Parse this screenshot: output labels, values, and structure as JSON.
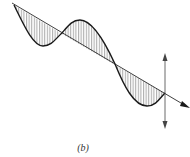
{
  "figure": {
    "caption": "(b)",
    "colors": {
      "wave": "#1a1a1a",
      "axis": "#2a2a2a",
      "hatch": "#555555",
      "arrow": "#444444",
      "background": "#ffffff"
    },
    "axis": {
      "start": [
        12,
        3
      ],
      "end": [
        188,
        107
      ]
    },
    "arrow": {
      "x": 165,
      "top": 54,
      "bottom": 128
    },
    "wave_points": [
      [
        14,
        5
      ],
      [
        43,
        46
      ],
      [
        62,
        33
      ],
      [
        80,
        20
      ],
      [
        115,
        64
      ],
      [
        147,
        106
      ],
      [
        165,
        93
      ]
    ]
  }
}
